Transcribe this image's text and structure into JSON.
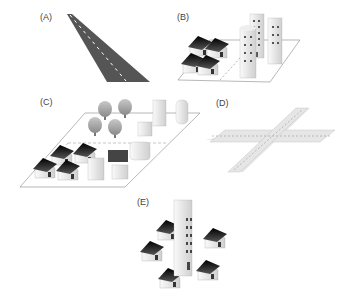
{
  "panels": [
    {
      "id": "A",
      "label": "(A)",
      "depicts": "road"
    },
    {
      "id": "B",
      "label": "(B)",
      "depicts": "houses and buildings separated by road"
    },
    {
      "id": "C",
      "label": "(C)",
      "depicts": "neighborhood with trees, houses, and buildings"
    },
    {
      "id": "D",
      "label": "(D)",
      "depicts": "road intersection"
    },
    {
      "id": "E",
      "label": "(E)",
      "depicts": "tall building surrounded by houses"
    }
  ],
  "colors": {
    "road_dark": "#555555",
    "road_light": "#e6e6e6",
    "roof": "#1a1a1a",
    "wall": "#f2f2f2",
    "ground_outline": "#888888"
  }
}
